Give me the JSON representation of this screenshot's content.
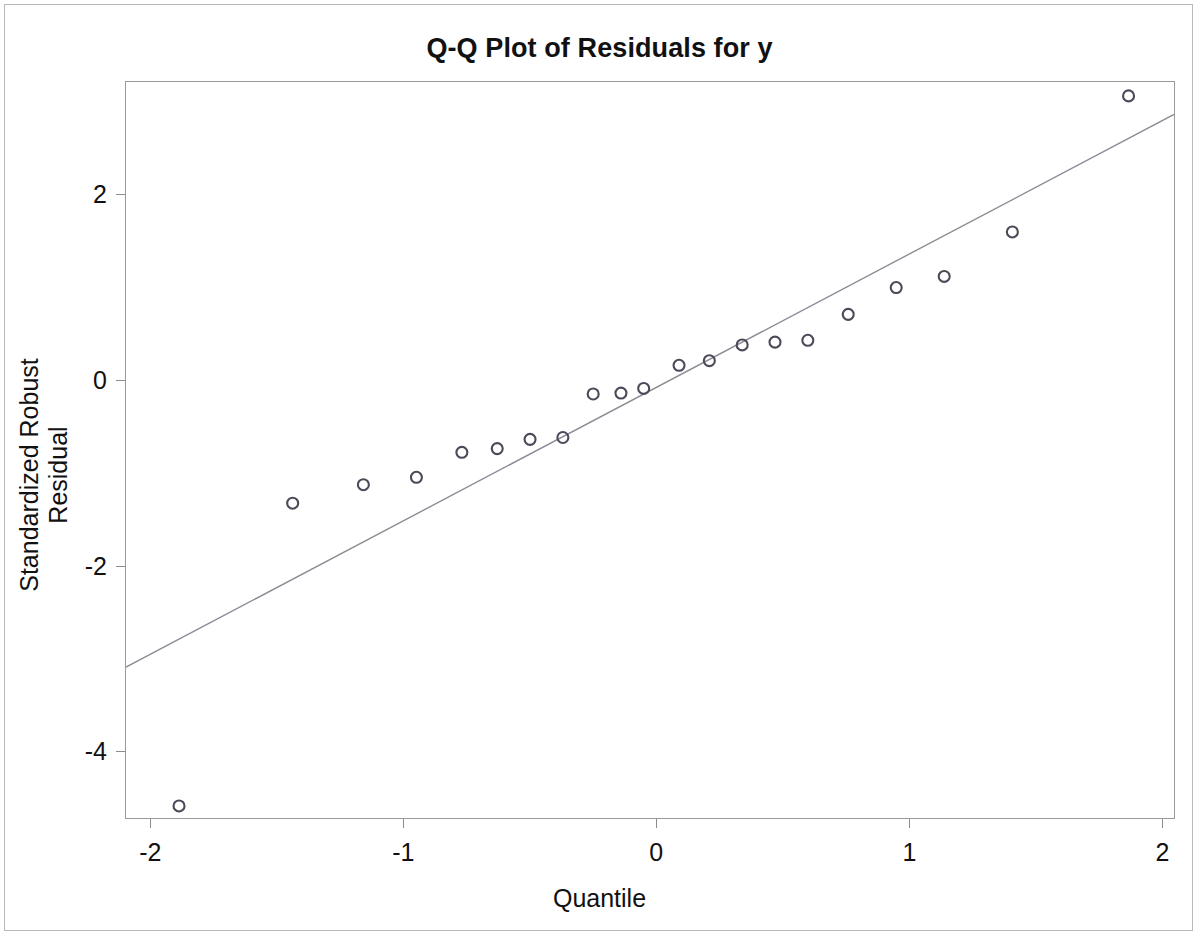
{
  "chart_data": {
    "type": "scatter",
    "title": "Q-Q Plot of Residuals for y",
    "xlabel": "Quantile",
    "ylabel": "Standardized Robust Residual",
    "xlim": [
      -2.1,
      2.05
    ],
    "ylim": [
      -4.73,
      3.22
    ],
    "grid": false,
    "legend": null,
    "xticks": [
      -2,
      -1,
      0,
      1,
      2
    ],
    "xtick_labels": [
      "-2",
      "-1",
      "0",
      "1",
      "2"
    ],
    "yticks": [
      2,
      0,
      -2,
      -4
    ],
    "ytick_labels": [
      "2",
      "0",
      "-2",
      "-4"
    ],
    "marker": "open-circle",
    "marker_color": "#4a4a58",
    "marker_size": 11,
    "line_color": "#8c8c96",
    "points": [
      {
        "x": -1.89,
        "y": -4.6
      },
      {
        "x": -1.44,
        "y": -1.33
      },
      {
        "x": -1.16,
        "y": -1.13
      },
      {
        "x": -0.95,
        "y": -1.05
      },
      {
        "x": -0.77,
        "y": -0.78
      },
      {
        "x": -0.63,
        "y": -0.74
      },
      {
        "x": -0.5,
        "y": -0.64
      },
      {
        "x": -0.37,
        "y": -0.62
      },
      {
        "x": -0.25,
        "y": -0.15
      },
      {
        "x": -0.14,
        "y": -0.14
      },
      {
        "x": -0.05,
        "y": -0.09
      },
      {
        "x": 0.09,
        "y": 0.16
      },
      {
        "x": 0.21,
        "y": 0.21
      },
      {
        "x": 0.34,
        "y": 0.38
      },
      {
        "x": 0.47,
        "y": 0.41
      },
      {
        "x": 0.6,
        "y": 0.43
      },
      {
        "x": 0.76,
        "y": 0.71
      },
      {
        "x": 0.95,
        "y": 1.0
      },
      {
        "x": 1.14,
        "y": 1.12
      },
      {
        "x": 1.41,
        "y": 1.6
      },
      {
        "x": 1.87,
        "y": 3.07
      }
    ],
    "reference_line": {
      "x1": -2.1,
      "y1": -3.1,
      "x2": 2.05,
      "y2": 2.87,
      "description": "normal reference line"
    }
  }
}
